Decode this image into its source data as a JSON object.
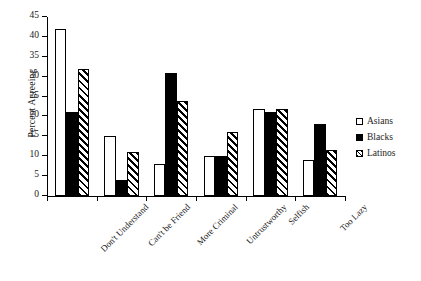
{
  "chart_data": {
    "type": "bar",
    "title": "",
    "subtitle": "",
    "xlabel": "",
    "ylabel": "Percent Agreeing",
    "ylim": [
      0,
      45
    ],
    "ytick_step": 5,
    "yticks": [
      0,
      5,
      10,
      15,
      20,
      25,
      30,
      35,
      40,
      45
    ],
    "ytick_labels": [
      "0",
      "5",
      "10",
      "15",
      "20",
      "25",
      "30",
      "35",
      "40",
      "45"
    ],
    "grid": false,
    "legend_position": "right",
    "categories": [
      "Don't Understand",
      "Can't be Friend",
      "More Criminal",
      "Untrustworthy",
      "Selfish",
      "Too Lazy"
    ],
    "series": [
      {
        "name": "Asians",
        "fill": "open",
        "values": [
          42,
          15,
          8,
          10,
          22,
          9
        ]
      },
      {
        "name": "Blacks",
        "fill": "solid",
        "values": [
          21,
          4,
          31,
          10,
          21,
          18
        ]
      },
      {
        "name": "Latinos",
        "fill": "hatch",
        "values": [
          32,
          11,
          24,
          16,
          22,
          11.5
        ]
      }
    ]
  },
  "legend": {
    "items": [
      {
        "label": "Asians",
        "fill": "open"
      },
      {
        "label": "Blacks",
        "fill": "solid"
      },
      {
        "label": "Latinos",
        "fill": "hatch"
      }
    ]
  },
  "colors": {
    "axis": "#000000",
    "bar_outline": "#000000",
    "series_asians": "#ffffff",
    "series_blacks": "#000000",
    "series_latinos": "#ffffff",
    "background": "#ffffff"
  }
}
